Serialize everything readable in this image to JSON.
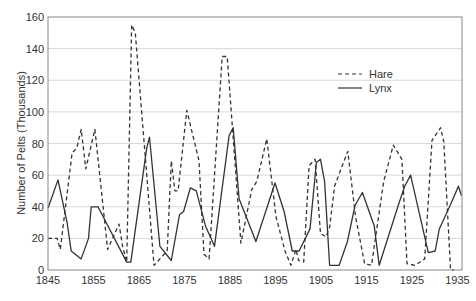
{
  "chart_data": {
    "type": "line",
    "title": "",
    "xlabel": "",
    "ylabel": "Number of Pelts (Thousands)",
    "xlim": [
      1845,
      1936
    ],
    "ylim": [
      0,
      160
    ],
    "xticks": [
      1845,
      1855,
      1865,
      1875,
      1885,
      1895,
      1905,
      1915,
      1925,
      1935
    ],
    "yticks": [
      0,
      20,
      40,
      60,
      80,
      100,
      120,
      140,
      160
    ],
    "grid": "horizontal",
    "legend": {
      "position": "upper right (inside)",
      "entries": [
        "Hare",
        "Lynx"
      ]
    },
    "series": [
      {
        "name": "Hare",
        "style": "dashed",
        "color": "#333333",
        "x": [
          1845,
          1847,
          1847.7,
          1850.3,
          1851.3,
          1852.3,
          1853.3,
          1855.3,
          1858.1,
          1860.6,
          1861.4,
          1862.3,
          1863.4,
          1864.2,
          1868.3,
          1871.2,
          1872.1,
          1872.9,
          1873.6,
          1875.5,
          1878.2,
          1879.3,
          1880.4,
          1883.3,
          1884.4,
          1887.4,
          1889.8,
          1890.9,
          1893.1,
          1895.1,
          1897.1,
          1898.4,
          1899.5,
          1900.1,
          1901.2,
          1902.4,
          1903.7,
          1904.9,
          1906.1,
          1906.9,
          1908.0,
          1908.9,
          1910.9,
          1912.6,
          1914.6,
          1916.1,
          1918.8,
          1920.9,
          1922.8,
          1923.9,
          1925.7,
          1927.8,
          1929.4,
          1931.3,
          1932.0,
          1933.5,
          1934.2
        ],
        "values": [
          20,
          20,
          13,
          74,
          77,
          89,
          64,
          89,
          13,
          29,
          15,
          5,
          155,
          150,
          3,
          12,
          69,
          50,
          50,
          101,
          69,
          10,
          7,
          135,
          135,
          17,
          51,
          56,
          83,
          34,
          12,
          3,
          13,
          6,
          5,
          66,
          70,
          23,
          21,
          27,
          53,
          60,
          75,
          34,
          4,
          3,
          56,
          79,
          70,
          4,
          3,
          7,
          82,
          90,
          81,
          0,
          0
        ]
      },
      {
        "name": "Lynx",
        "style": "solid",
        "color": "#333333",
        "x": [
          1845,
          1847.2,
          1849.2,
          1850.1,
          1852.3,
          1853.9,
          1854.5,
          1856.0,
          1862.3,
          1863.2,
          1866.7,
          1867.3,
          1869.6,
          1872.1,
          1873.9,
          1874.8,
          1876.3,
          1877.6,
          1879.6,
          1881.6,
          1884.8,
          1885.7,
          1887.0,
          1890.7,
          1894.9,
          1896.9,
          1898.7,
          1900.2,
          1902.6,
          1904.0,
          1904.9,
          1905.8,
          1906.9,
          1909.0,
          1910.8,
          1912.5,
          1914.1,
          1916.7,
          1917.8,
          1922.0,
          1923.4,
          1924.7,
          1928.6,
          1930.1,
          1931.0,
          1933.4,
          1935.2,
          1935.9
        ],
        "values": [
          39,
          57,
          30,
          12,
          7,
          20,
          40,
          40,
          5,
          5,
          77,
          84,
          15,
          6,
          35,
          37,
          52,
          50,
          28,
          15,
          85,
          90,
          45,
          18,
          55,
          37,
          12,
          12,
          26,
          68,
          70,
          56,
          3,
          3,
          18,
          41,
          49,
          28,
          3,
          41,
          53,
          60,
          11,
          12,
          26,
          41,
          53,
          47
        ]
      }
    ]
  }
}
